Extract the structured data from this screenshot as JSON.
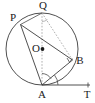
{
  "figure": {
    "name": "circle-tangent-inscribed-angle-figure",
    "width": 95,
    "height": 103,
    "background_color": "#ffffff",
    "stroke_color": "#3c3c3c",
    "label_color": "#1a1a1a",
    "dotted_color": "#8c8c8c"
  },
  "labels": {
    "P": "P",
    "Q": "Q",
    "O": "O",
    "B": "B",
    "A": "A",
    "T": "T"
  },
  "points": {
    "P": {
      "x": 20.5,
      "y": 24.5
    },
    "Q": {
      "x": 42.0,
      "y": 13.0
    },
    "O": {
      "x": 42.0,
      "y": 49.0
    },
    "B": {
      "x": 72.5,
      "y": 60.0
    },
    "A": {
      "x": 42.0,
      "y": 85.0
    },
    "T": {
      "x": 90.0,
      "y": 85.0
    }
  },
  "label_positions": {
    "P": {
      "x": 13.0,
      "y": 18.0
    },
    "Q": {
      "x": 43.0,
      "y": 6.0
    },
    "O": {
      "x": 36.0,
      "y": 49.0
    },
    "B": {
      "x": 80.0,
      "y": 61.0
    },
    "A": {
      "x": 42.0,
      "y": 95.0
    },
    "T": {
      "x": 87.0,
      "y": 95.0
    }
  },
  "circle": {
    "cx": 42.0,
    "cy": 49.0,
    "r": 36.0
  },
  "center_dot": {
    "cx": 42.5,
    "cy": 49.0,
    "r": 1.9
  },
  "segments": [
    {
      "name": "chord-P-A",
      "from": "P",
      "to": "A",
      "style": "solid"
    },
    {
      "name": "chord-P-B",
      "from": "P",
      "to": "B",
      "style": "solid"
    },
    {
      "name": "chord-A-B",
      "from": "A",
      "to": "B",
      "style": "solid"
    },
    {
      "name": "diameter-Q-A",
      "from": "Q",
      "to": "A",
      "style": "dotted"
    },
    {
      "name": "chord-Q-B",
      "from": "Q",
      "to": "B",
      "style": "dotted"
    },
    {
      "name": "chord-Q-P",
      "from": "Q",
      "to": "P",
      "style": "solid"
    },
    {
      "name": "tangent-A-T",
      "from": "A",
      "to": "T",
      "style": "solid"
    }
  ],
  "markers": [
    {
      "name": "right-angle-marker-at-B",
      "x": 72.5,
      "y": 60.0
    },
    {
      "name": "angle-arc-at-A-tangent",
      "x": 42.0,
      "y": 85.0
    },
    {
      "name": "angle-arc-at-A-chord",
      "x": 42.0,
      "y": 85.0
    },
    {
      "name": "angle-arc-at-Q",
      "x": 42.0,
      "y": 13.0
    }
  ]
}
